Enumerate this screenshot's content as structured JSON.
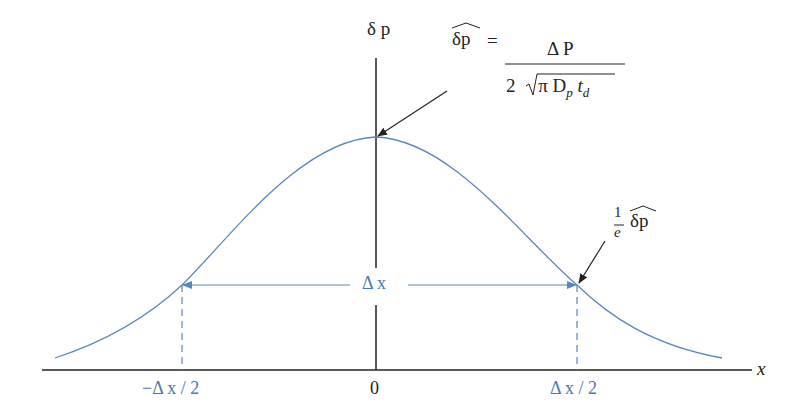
{
  "diagram": {
    "type": "gaussian-distribution",
    "colors": {
      "curve": "#5a86c0",
      "axis": "#222222",
      "annotation": "#4a78b0"
    },
    "axes": {
      "y_label": "δ p",
      "x_label": "x"
    },
    "ticks": [
      {
        "label": "−Δ x / 2"
      },
      {
        "label": "0"
      },
      {
        "label": "Δ x / 2"
      }
    ],
    "width_marker": {
      "label": "Δ x"
    },
    "peak_annotation": {
      "lhs": "δp",
      "equals": "=",
      "numerator": "Δ P",
      "denominator_coef": "2",
      "denominator_radicand": "π D",
      "denominator_sub_p": "p",
      "denominator_t": "t",
      "denominator_sub_d": "d"
    },
    "decay_annotation": {
      "numerator": "1",
      "denominator": "e",
      "symbol": "δp"
    }
  }
}
